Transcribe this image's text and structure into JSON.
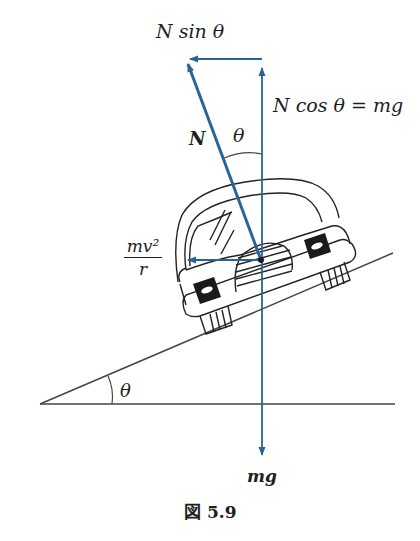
{
  "figure": {
    "caption": "図 5.9",
    "labels": {
      "n_sin_theta": "N sin θ",
      "n_cos_theta": "N cos θ = mg",
      "normal_force": "N",
      "theta_top": "θ",
      "centripetal_num": "mv²",
      "centripetal_den": "r",
      "theta_bottom": "θ",
      "weight": "mg"
    },
    "colors": {
      "vector": "#2a6496",
      "line": "#333333",
      "text": "#1e1e1e"
    }
  }
}
